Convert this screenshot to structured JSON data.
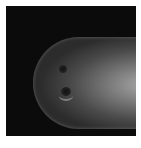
{
  "image": {
    "description": "Grayscale micrograph of a rounded elongated organism tip against a dark background, with two dark spots near the anterior end",
    "colors": {
      "background": "#0b0b0b",
      "border": "#ffffff",
      "highlight": "#a8a8a8"
    }
  }
}
